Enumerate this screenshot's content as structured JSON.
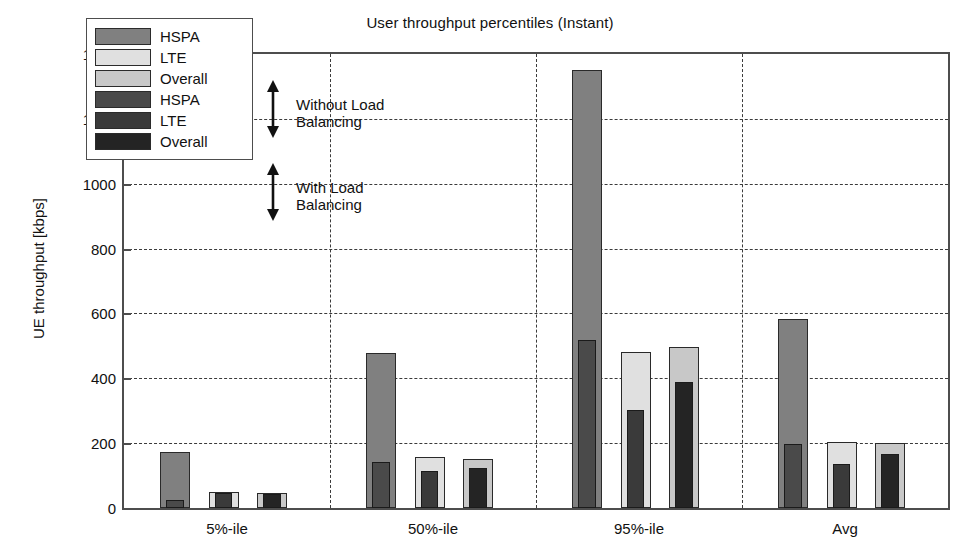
{
  "chart_data": {
    "type": "bar",
    "title": "User throughput percentiles (Instant)",
    "xlabel": "",
    "ylabel": "UE throughput [kbps]",
    "ylim": [
      0,
      1400
    ],
    "yticks": [
      0,
      200,
      400,
      600,
      800,
      1000,
      1200,
      1400
    ],
    "ytick_labels": [
      "0",
      "200",
      "400",
      "600",
      "800",
      "1000",
      "1200",
      "1400"
    ],
    "grid": true,
    "legend_position": "upper-left-inside",
    "categories": [
      "5%-ile",
      "50%-ile",
      "95%-ile",
      "Avg"
    ],
    "subcategories": [
      "HSPA",
      "LTE",
      "Overall"
    ],
    "series": [
      {
        "name": "HSPA",
        "condition": "Without Load Balancing",
        "color": "#808080",
        "values": [
          172,
          477,
          1352,
          583
        ]
      },
      {
        "name": "LTE",
        "condition": "Without Load Balancing",
        "color": "#e0e0e0",
        "values": [
          48,
          158,
          482,
          205
        ]
      },
      {
        "name": "Overall",
        "condition": "Without Load Balancing",
        "color": "#c8c8c8",
        "values": [
          46,
          152,
          497,
          202
        ]
      },
      {
        "name": "HSPA",
        "condition": "With Load Balancing",
        "color": "#4a4a4a",
        "values": [
          26,
          141,
          519,
          197
        ]
      },
      {
        "name": "LTE",
        "condition": "With Load Balancing",
        "color": "#3a3a3a",
        "values": [
          47,
          113,
          302,
          137
        ]
      },
      {
        "name": "Overall",
        "condition": "With Load Balancing",
        "color": "#242424",
        "values": [
          44,
          123,
          390,
          166
        ]
      }
    ],
    "annotations": [
      {
        "text": "Without Load\nBalancing",
        "arrow": "double-vertical"
      },
      {
        "text": "With Load\nBalancing",
        "arrow": "double-vertical"
      }
    ]
  },
  "legend": {
    "items": [
      {
        "label": "HSPA",
        "color": "#808080"
      },
      {
        "label": "LTE",
        "color": "#e0e0e0"
      },
      {
        "label": "Overall",
        "color": "#c8c8c8"
      },
      {
        "label": "HSPA",
        "color": "#4a4a4a"
      },
      {
        "label": "LTE",
        "color": "#3a3a3a"
      },
      {
        "label": "Overall",
        "color": "#242424"
      }
    ]
  },
  "annotations": {
    "without_lb": "Without Load\nBalancing",
    "with_lb": "With Load\nBalancing"
  }
}
